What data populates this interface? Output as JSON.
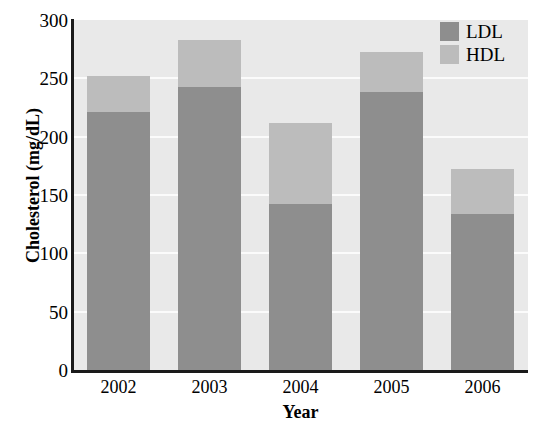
{
  "chart_data": {
    "type": "bar",
    "subtype": "stacked-bar",
    "title": "",
    "xlabel": "Year",
    "ylabel": "Cholesterol (mg/dL)",
    "categories": [
      "2002",
      "2003",
      "2004",
      "2005",
      "2006"
    ],
    "series": [
      {
        "name": "LDL",
        "values": [
          221,
          243,
          142,
          238,
          134
        ],
        "color": "#8e8e8e"
      },
      {
        "name": "HDL",
        "values": [
          31,
          40,
          70,
          35,
          38
        ],
        "color": "#bcbcbc"
      }
    ],
    "totals": [
      252,
      283,
      212,
      273,
      172
    ],
    "ylim": [
      0,
      300
    ],
    "yticks": [
      0,
      50,
      100,
      150,
      200,
      250,
      300
    ],
    "ytick_labels": [
      "0",
      "50",
      "100",
      "150",
      "200",
      "250",
      "300"
    ],
    "grid": true,
    "grid_color": "#fbfbfb",
    "plot_background": "#e9e9e9",
    "legend_position": "top-right",
    "legend_entries": [
      "LDL",
      "HDL"
    ]
  }
}
